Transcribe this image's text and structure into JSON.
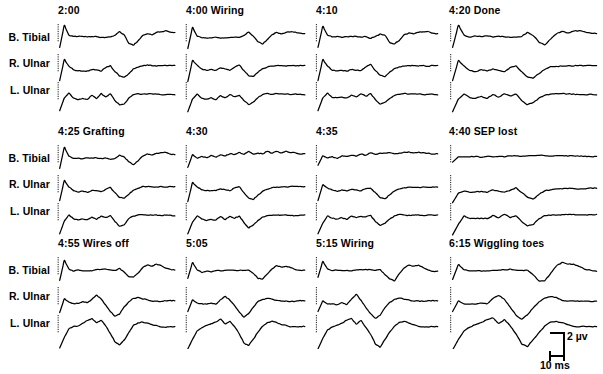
{
  "figure": {
    "row_labels": [
      "B. Tibial",
      "R. Ulnar",
      "L. Ulnar"
    ],
    "line_color": "#000000",
    "background_color": "#ffffff"
  },
  "scale_bar": {
    "vertical_label": "2 µv",
    "horizontal_label": "10 ms",
    "vertical_value": 2,
    "vertical_unit": "µv",
    "horizontal_value": 10,
    "horizontal_unit": "ms"
  },
  "panels": [
    {
      "id": "p-2-00",
      "time": "2:00",
      "event": "",
      "title": "2:00"
    },
    {
      "id": "p-4-00",
      "time": "4:00",
      "event": "Wiring",
      "title": "4:00 Wiring"
    },
    {
      "id": "p-4-10",
      "time": "4:10",
      "event": "",
      "title": "4:10"
    },
    {
      "id": "p-4-20",
      "time": "4:20",
      "event": "Done",
      "title": "4:20 Done"
    },
    {
      "id": "p-4-25",
      "time": "4:25",
      "event": "Grafting",
      "title": "4:25 Grafting"
    },
    {
      "id": "p-4-30",
      "time": "4:30",
      "event": "",
      "title": "4:30"
    },
    {
      "id": "p-4-35",
      "time": "4:35",
      "event": "",
      "title": "4:35"
    },
    {
      "id": "p-4-40",
      "time": "4:40",
      "event": "SEP lost",
      "title": "4:40 SEP lost"
    },
    {
      "id": "p-4-55",
      "time": "4:55",
      "event": "Wires off",
      "title": "4:55 Wires off"
    },
    {
      "id": "p-5-05",
      "time": "5:05",
      "event": "",
      "title": "5:05"
    },
    {
      "id": "p-5-15",
      "time": "5:15",
      "event": "Wiring",
      "title": "5:15 Wiring"
    },
    {
      "id": "p-6-15",
      "time": "6:15",
      "event": "Wiggling toes",
      "title": "6:15 Wiggling toes"
    }
  ],
  "chart_data": {
    "type": "line",
    "xlabel": "",
    "ylabel": "",
    "grid": false,
    "legend": "none",
    "units": {
      "x": "ms",
      "y": "µv"
    },
    "channels": [
      "B. Tibial",
      "R. Ulnar",
      "L. Ulnar"
    ],
    "panel_titles": [
      "2:00",
      "4:00 Wiring",
      "4:10",
      "4:20 Done",
      "4:25 Grafting",
      "4:30",
      "4:35",
      "4:40 SEP lost",
      "4:55 Wires off",
      "5:05",
      "5:15 Wiring",
      "6:15 Wiggling toes"
    ],
    "series": [
      {
        "panel": "2:00",
        "channel": "B. Tibial",
        "points": "0,-9 1,12 2,3 3,1 4,1.5 5,1 6,1.5 7,1 8,1.5 9,1 10,1 11,0.5 12,2 13,6 14,3 15,-5 16,-7 17,-3 18,2 19,4 20,3 21,5 22,6 23,7 24,6 25,5"
      },
      {
        "panel": "2:00",
        "channel": "R. Ulnar",
        "points": "0,-12 1,8 2,2 3,-2 4,-3 5,-2.5 6,-3 7,-1 8,-2 9,-3 10,0 11,2 12,-3 13,-8 14,-9 15,-5 16,-1 17,1 18,2 19,2.5 20,2 21,2 22,2 23,2 24,2 25,2"
      },
      {
        "panel": "2:00",
        "channel": "L. Ulnar",
        "points": "0,-14 1,-2 2,3 3,-2 4,-3 5,-2 6,-3 7,1 8,-2 9,2 10,-1 11,2 12,-4 13,-9 14,-7 15,-2 16,1 17,2 18,2 19,2 20,1.5 21,1.5 22,1.5 23,1.5 24,1.5 25,1.5"
      },
      {
        "panel": "4:00 Wiring",
        "channel": "B. Tibial",
        "points": "0,-10 1,10 2,2 3,0 4,0.5 5,0 6,0.5 7,0 8,0.5 9,0 10,1 11,0.5 12,2 13,5 14,2 15,-4 16,-6 17,-2 18,3 19,5 20,4 21,5 22,6 23,6 24,5 25,4"
      },
      {
        "panel": "4:00 Wiring",
        "channel": "R. Ulnar",
        "points": "0,-13 1,7 2,3 3,-1 4,-2 5,-1.5 6,-2 7,0 8,-1 9,-2 10,1 11,3 12,-2 13,-7 14,-8 15,-4 16,-1 17,1 18,2 19,2.5 20,2 21,2 22,2 23,2 24,2 25,2"
      },
      {
        "panel": "4:00 Wiring",
        "channel": "L. Ulnar",
        "points": "0,-15 1,-3 2,2 3,-2 4,-3 5,-2 6,-3 7,0 8,-2 9,1 10,-1 11,1 12,-4 13,-8 14,-6 15,-2 16,1 17,2 18,2 19,2 20,1.5 21,1.5 22,1.5 23,1.5 24,1.5 25,1.5"
      },
      {
        "panel": "4:10",
        "channel": "B. Tibial",
        "points": "0,-9 1,11 2,3 3,1 4,1.5 5,1 6,1.5 7,1 8,1 9,0.5 10,1 11,0 12,1 13,4 14,2 15,-4 16,-6 17,-2 18,3 19,5 20,4 21,5 22,6 23,6 24,5 25,4"
      },
      {
        "panel": "4:10",
        "channel": "R. Ulnar",
        "points": "0,-12 1,8 2,2 3,-2 4,-3 5,-2 6,-2.5 7,-1 8,-2 9,-2 10,1 11,3 12,-2 13,-7 14,-8 15,-4 16,-1 17,1 18,2 19,2 20,2 21,2 22,2 23,2 24,2 25,2"
      },
      {
        "panel": "4:10",
        "channel": "L. Ulnar",
        "points": "0,-14 1,-2 2,3 3,-1 4,-2 5,-1 6,-2 7,1 8,-1 9,2 10,0 11,2 12,-3 13,-8 14,-6 15,-2 16,1 17,2 18,2 19,2 20,1.5 21,1.5 22,1.5 23,1.5 24,1.5 25,1.5"
      },
      {
        "panel": "4:20 Done",
        "channel": "B. Tibial",
        "points": "0,-9 1,12 2,3 3,1 4,1.5 5,1 6,1.5 7,1 8,1.5 9,1 10,1 11,0.5 12,2 13,5 14,2 15,-4 16,-6 17,-1 18,4 19,6 20,5 21,6 22,7 23,6 24,5 25,4"
      },
      {
        "panel": "4:20 Done",
        "channel": "R. Ulnar",
        "points": "0,-12 1,7 2,2 3,-2 4,-3 5,-2 6,-3 7,-1 8,-2 9,-3 10,0 11,2 12,-3 13,-8 14,-9 15,-5 16,-1 17,1 18,2 19,2 20,2 21,2 22,2 23,2 24,2 25,2"
      },
      {
        "panel": "4:20 Done",
        "channel": "L. Ulnar",
        "points": "0,-15 1,-3 2,2 3,-2 4,-2 5,-1 6,-2 7,1 8,-1 9,2 10,0 11,2 12,-4 13,-8 14,-6 15,-2 16,1 17,2 18,2 19,2 20,1.5 21,1.5 22,1.5 23,1.5 24,1.5 25,1.5"
      },
      {
        "panel": "4:25 Grafting",
        "channel": "B. Tibial",
        "points": "0,-9 1,11 2,3 3,1 4,1 5,0.5 6,1 7,0.5 8,1 9,0.5 10,1 11,0 12,1 13,4 14,2 15,-3 16,-5 17,-2 18,3 19,5 20,4 21,5 22,6 23,6 24,5 25,4"
      },
      {
        "panel": "4:25 Grafting",
        "channel": "R. Ulnar",
        "points": "0,-11 1,8 2,2 3,-2 4,-3 5,-2 6,-3 7,-1 8,-2 9,-3 10,0 11,2 12,-3 13,-8 14,-9 15,-5 16,-1 17,1 18,2 19,2 20,2 21,2 22,2 23,2 24,2 25,2"
      },
      {
        "panel": "4:25 Grafting",
        "channel": "L. Ulnar",
        "points": "0,-16 1,-4 2,2 3,-2 4,-3 5,-2 6,-3 7,0 8,-2 9,1 10,-1 11,1 12,-4 13,-9 14,-7 15,-2 16,1 17,2 18,2 19,2 20,1.5 21,1.5 22,1.5 23,1.5 24,1.5 25,1.5"
      },
      {
        "panel": "4:30",
        "channel": "B. Tibial",
        "points": "0,-8 1,4 2,1 3,2 4,1 5,3 6,2 7,4 8,3 9,5 10,4 11,6 12,5 13,7 14,5 15,6 16,5 17,7 18,6 19,7 20,6 21,7 22,6 23,6 24,5 25,5"
      },
      {
        "panel": "4:30",
        "channel": "R. Ulnar",
        "points": "0,-12 1,6 2,2 3,-1 4,-2 5,-1 6,-2 7,0 8,-1 9,-2 10,1 11,2 12,-3 13,-9 14,-10 15,-6 16,-2 17,0 18,1 19,2 20,2 21,2 22,2 23,2 24,2 25,2"
      },
      {
        "panel": "4:30",
        "channel": "L. Ulnar",
        "points": "0,-16 1,-5 2,1 3,-2 4,-3 5,-2 6,-3 7,0 8,-2 9,1 10,-1 11,1 12,-5 13,-10 14,-8 15,-3 16,0 17,1 18,1.5 19,1.5 20,1.5 21,1.5 22,1.5 23,1.5 24,1.5 25,1.5"
      },
      {
        "panel": "4:35",
        "channel": "B. Tibial",
        "points": "0,-6 1,3 2,1 3,2 4,1 5,3 6,2 7,4 8,3 9,5 10,4 11,6 12,5 13,6 14,5 15,6 16,5 17,6 18,6 19,7 20,6 21,6 22,6 23,6 24,5 25,5"
      },
      {
        "panel": "4:35",
        "channel": "R. Ulnar",
        "points": "0,-11 1,4 2,1 3,-1 4,-2 5,-1 6,-2 7,0 8,-1 9,-2 10,0 11,1 12,-3 13,-8 14,-9 15,-5 16,-2 17,0 18,1 19,1.5 20,1.5 21,1.5 22,1.5 23,1.5 24,1.5 25,1.5"
      },
      {
        "panel": "4:35",
        "channel": "L. Ulnar",
        "points": "0,-16 1,-6 2,1 3,-1 4,-2 5,-1 6,-2 7,1 8,-1 9,1 10,0 11,1 12,-4 13,-8 14,-6 15,-2 16,1 17,2 18,2 19,2 20,1.5 21,1.5 22,1.5 23,1.5 24,1.5 25,1.5"
      },
      {
        "panel": "4:40 SEP lost",
        "channel": "B. Tibial",
        "points": "0,-3 1,2 2,2 3,2 4,2.5 5,2 6,2.5 7,2 8,3 9,2.5 10,3 11,2.5 12,3 13,3 14,3 15,3 16,3 17,3 18,3 19,3 20,3 21,2.5 22,2.5 23,2.5 24,2.5 25,2.5"
      },
      {
        "panel": "4:40 SEP lost",
        "channel": "R. Ulnar",
        "points": "0,-13 1,-4 2,-2 3,-3 4,-3 5,-2 6,-3 7,-1 8,-2 9,-3 10,-1 11,1 12,-3 13,-8 14,-9 15,-5 16,-2 17,-1 18,0 19,0.5 20,0.5 21,0.5 22,0.5 23,0.5 24,0.5 25,0.5"
      },
      {
        "panel": "4:40 SEP lost",
        "channel": "L. Ulnar",
        "points": "0,-17 1,-7 2,1 3,-1 4,-2 5,-1 6,-2 7,1 8,-1 9,2 10,0 11,1 12,-4 13,-9 14,-7 15,-2 16,1 17,2 18,2 19,2 20,2 21,2 22,2 23,2 24,2 25,2"
      },
      {
        "panel": "4:55 Wires off",
        "channel": "B. Tibial",
        "points": "0,-9 1,10 2,2 3,0 4,0.5 5,0 6,0.5 7,0.5 8,1 9,1 10,1.5 11,1 12,1 13,2 14,-1 15,-5 16,-6 17,-2 18,3 19,6 20,5 21,6 22,5 23,3 24,2 25,1"
      },
      {
        "panel": "4:55 Wires off",
        "channel": "R. Ulnar",
        "points": "0,-11 1,2 2,-1 3,-2 4,-2 5,-1 6,-2 7,2 8,6 9,2 10,-4 11,-10 12,-14 13,-12 14,-6 15,-1 16,2 17,3 18,2 19,1 20,0 21,0 22,0 23,0 24,0 25,0"
      },
      {
        "panel": "4:55 Wires off",
        "channel": "L. Ulnar",
        "points": "0,-18 1,-8 2,0 3,2 4,3 5,5 6,8 7,10 8,6 9,8 10,3 11,-4 12,-12 13,-15 14,-10 15,-3 16,3 17,6 18,7 19,6 20,4 21,3 22,2 23,2 24,2 25,2"
      },
      {
        "panel": "5:05",
        "channel": "B. Tibial",
        "points": "0,-7 1,8 2,1 3,-1 4,0 5,-0.5 6,0 7,0 8,0.5 9,0.5 10,1 11,1 12,1 13,1 14,-2 15,-7 16,-8 17,-3 18,2 19,5 20,4 21,5 22,3 23,1 24,1 25,1"
      },
      {
        "panel": "5:05",
        "channel": "R. Ulnar",
        "points": "0,-10 1,1 2,-2 3,-3 4,-3 5,-2 6,-3 7,1 8,5 9,1 10,-5 11,-11 12,-15 13,-12 14,-6 15,-1 16,2 17,3 18,2 19,1 20,0 21,0 22,0 23,0 24,0 25,0"
      },
      {
        "panel": "5:05",
        "channel": "L. Ulnar",
        "points": "0,-19 1,-10 2,-2 3,1 4,3 5,5 6,7 7,9 8,5 9,7 10,2 11,-5 12,-13 13,-16 14,-10 15,-3 16,3 17,6 18,7 19,6 20,4 21,3 22,2 23,2 24,2 25,2"
      },
      {
        "panel": "5:15 Wiring",
        "channel": "B. Tibial",
        "points": "0,-6 1,9 2,2 3,0 4,0.5 5,0 6,0.5 7,0.5 8,1 9,1 10,1.5 11,1 12,1 13,1 14,-3 15,-8 16,-9 17,-3 18,3 19,6 20,5 21,6 22,3 23,1 24,0 25,0"
      },
      {
        "panel": "5:15 Wiring",
        "channel": "R. Ulnar",
        "points": "0,-10 1,0 2,-3 3,-3 4,-3 5,-2 6,-3 7,2 8,6 9,1 10,-6 11,-12 12,-16 13,-13 14,-6 15,-1 16,2 17,3 18,2 19,1 20,0 21,0 22,0 23,0 24,0 25,0"
      },
      {
        "panel": "5:15 Wiring",
        "channel": "L. Ulnar",
        "points": "0,-19 1,-9 2,-1 3,2 4,4 5,6 6,8 7,10 8,5 9,8 10,2 11,-5 12,-14 13,-17 14,-10 15,-3 16,3 17,6 18,7 19,6 20,4 21,3 22,2 23,2 24,2 25,2"
      },
      {
        "panel": "6:15 Wiggling toes",
        "channel": "B. Tibial",
        "points": "0,-8 1,6 2,1 3,0 4,0.5 5,0 6,0.5 7,0.5 8,1 9,1 10,1.5 11,1 12,1 13,1 14,-4 15,-9 16,-9 17,-2 18,5 19,8 20,7 21,7 22,4 23,2 24,1 25,0"
      },
      {
        "panel": "6:15 Wiggling toes",
        "channel": "R. Ulnar",
        "points": "0,-10 1,0 2,-3 3,-3 4,-3 5,-2 6,-3 7,2 8,5 9,1 10,-6 11,-13 12,-17 13,-13 14,-6 15,-1 16,3 17,4 18,3 19,1 20,0 21,0 22,0 23,0 24,0 25,0"
      },
      {
        "panel": "6:15 Wiggling toes",
        "channel": "L. Ulnar",
        "points": "0,-20 1,-10 2,-2 3,2 4,4 5,6 6,9 7,11 8,6 9,9 10,3 11,-5 12,-14 13,-17 14,-10 15,-3 16,3 17,6 18,7 19,6 20,4 21,3 22,2 23,2 24,2 25,2"
      }
    ]
  }
}
